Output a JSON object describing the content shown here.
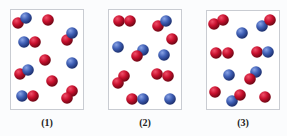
{
  "colors": {
    "red_atom": "#c8102e",
    "blue_atom": "#3f5fb5",
    "panel_border": "#c9ccd2"
  },
  "panels": [
    {
      "label": "(1)",
      "box": [
        10,
        9,
        74,
        101
      ],
      "label_pos": [
        47,
        124
      ],
      "atoms": [
        {
          "c": "red",
          "x": 18,
          "y": 23
        },
        {
          "c": "blue",
          "x": 26,
          "y": 18
        },
        {
          "c": "red",
          "x": 48,
          "y": 20
        },
        {
          "c": "red",
          "x": 67,
          "y": 40
        },
        {
          "c": "blue",
          "x": 72,
          "y": 33
        },
        {
          "c": "blue",
          "x": 24,
          "y": 42
        },
        {
          "c": "red",
          "x": 35,
          "y": 42
        },
        {
          "c": "red",
          "x": 45,
          "y": 60
        },
        {
          "c": "blue",
          "x": 72,
          "y": 63
        },
        {
          "c": "red",
          "x": 20,
          "y": 74
        },
        {
          "c": "blue",
          "x": 28,
          "y": 70
        },
        {
          "c": "red",
          "x": 52,
          "y": 81
        },
        {
          "c": "blue",
          "x": 22,
          "y": 96
        },
        {
          "c": "red",
          "x": 33,
          "y": 96
        },
        {
          "c": "red",
          "x": 72,
          "y": 91
        },
        {
          "c": "red",
          "x": 67,
          "y": 98
        }
      ]
    },
    {
      "label": "(2)",
      "box": [
        108,
        9,
        74,
        101
      ],
      "label_pos": [
        145,
        124
      ],
      "atoms": [
        {
          "c": "red",
          "x": 119,
          "y": 21
        },
        {
          "c": "red",
          "x": 130,
          "y": 21
        },
        {
          "c": "red",
          "x": 158,
          "y": 26
        },
        {
          "c": "blue",
          "x": 166,
          "y": 21
        },
        {
          "c": "red",
          "x": 172,
          "y": 39
        },
        {
          "c": "blue",
          "x": 118,
          "y": 47
        },
        {
          "c": "blue",
          "x": 143,
          "y": 50
        },
        {
          "c": "red",
          "x": 137,
          "y": 56
        },
        {
          "c": "blue",
          "x": 164,
          "y": 55
        },
        {
          "c": "red",
          "x": 124,
          "y": 76
        },
        {
          "c": "red",
          "x": 118,
          "y": 83
        },
        {
          "c": "red",
          "x": 157,
          "y": 74
        },
        {
          "c": "red",
          "x": 168,
          "y": 76
        },
        {
          "c": "red",
          "x": 132,
          "y": 99
        },
        {
          "c": "blue",
          "x": 143,
          "y": 99
        },
        {
          "c": "blue",
          "x": 170,
          "y": 99
        }
      ]
    },
    {
      "label": "(3)",
      "box": [
        206,
        10,
        74,
        100
      ],
      "label_pos": [
        243,
        124
      ],
      "atoms": [
        {
          "c": "red",
          "x": 214,
          "y": 24
        },
        {
          "c": "red",
          "x": 223,
          "y": 20
        },
        {
          "c": "blue",
          "x": 242,
          "y": 33
        },
        {
          "c": "blue",
          "x": 262,
          "y": 26
        },
        {
          "c": "red",
          "x": 270,
          "y": 20
        },
        {
          "c": "red",
          "x": 216,
          "y": 53
        },
        {
          "c": "red",
          "x": 228,
          "y": 53
        },
        {
          "c": "red",
          "x": 257,
          "y": 52
        },
        {
          "c": "blue",
          "x": 268,
          "y": 52
        },
        {
          "c": "blue",
          "x": 229,
          "y": 75
        },
        {
          "c": "blue",
          "x": 256,
          "y": 72
        },
        {
          "c": "red",
          "x": 250,
          "y": 79
        },
        {
          "c": "red",
          "x": 215,
          "y": 92
        },
        {
          "c": "blue",
          "x": 232,
          "y": 101
        },
        {
          "c": "red",
          "x": 240,
          "y": 95
        },
        {
          "c": "red",
          "x": 265,
          "y": 97
        }
      ]
    }
  ]
}
